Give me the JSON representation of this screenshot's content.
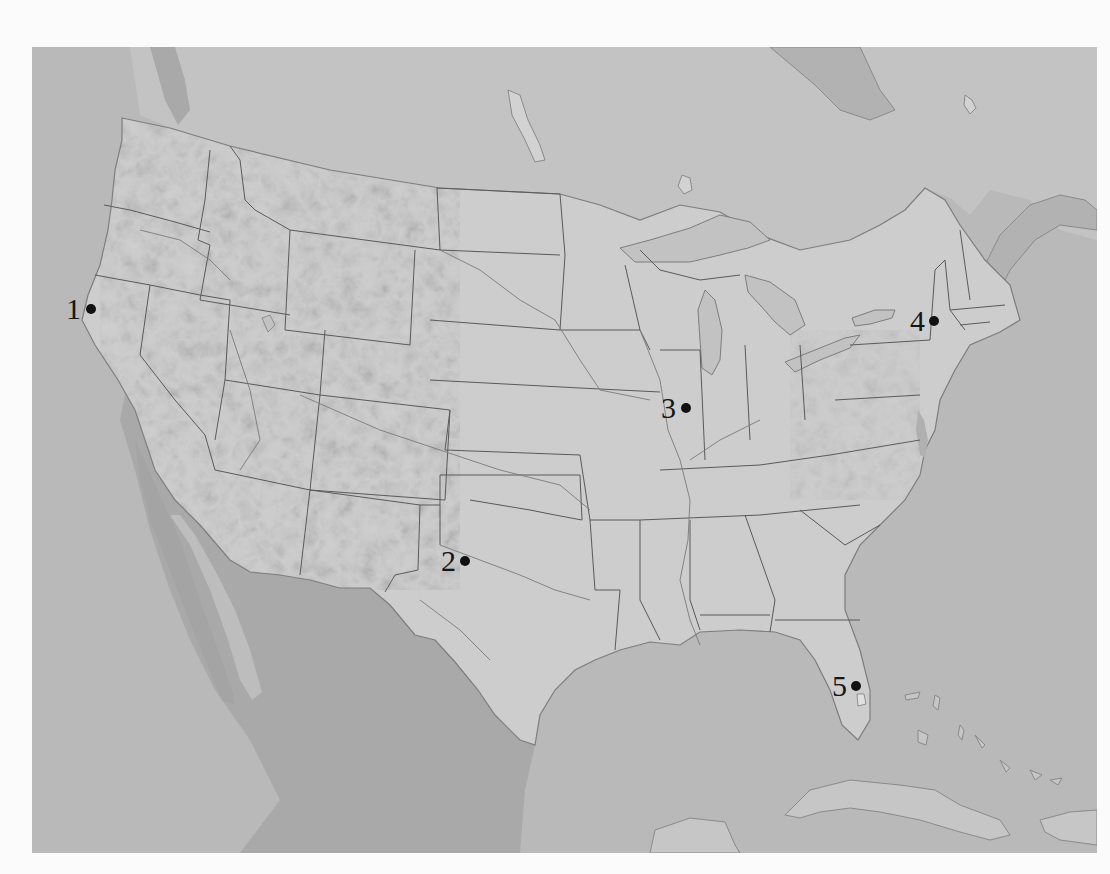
{
  "map": {
    "title_fragment": "",
    "region": "Contiguous United States",
    "style": "grayscale shaded relief with state boundaries and rivers",
    "colors": {
      "ocean": "#b9b9b9",
      "foreign_land": "#c6c6c6",
      "us_land": "#cdcdcd",
      "mexico": "#a8a8a8",
      "state_border": "#5a5a5a",
      "river": "#7a7a7a",
      "marker": "#111111",
      "page_background": "#fbfbfb"
    },
    "markers": [
      {
        "id": 1,
        "label": "1",
        "location_hint": "Northern California coast",
        "dot_x": 91,
        "dot_y": 309
      },
      {
        "id": 2,
        "label": "2",
        "location_hint": "West-central Texas",
        "dot_x": 465,
        "dot_y": 561
      },
      {
        "id": 3,
        "label": "3",
        "location_hint": "Central Illinois",
        "dot_x": 686,
        "dot_y": 408
      },
      {
        "id": 4,
        "label": "4",
        "location_hint": "Eastern New York",
        "dot_x": 934,
        "dot_y": 321
      },
      {
        "id": 5,
        "label": "5",
        "location_hint": "Central Florida",
        "dot_x": 856,
        "dot_y": 686
      }
    ]
  }
}
